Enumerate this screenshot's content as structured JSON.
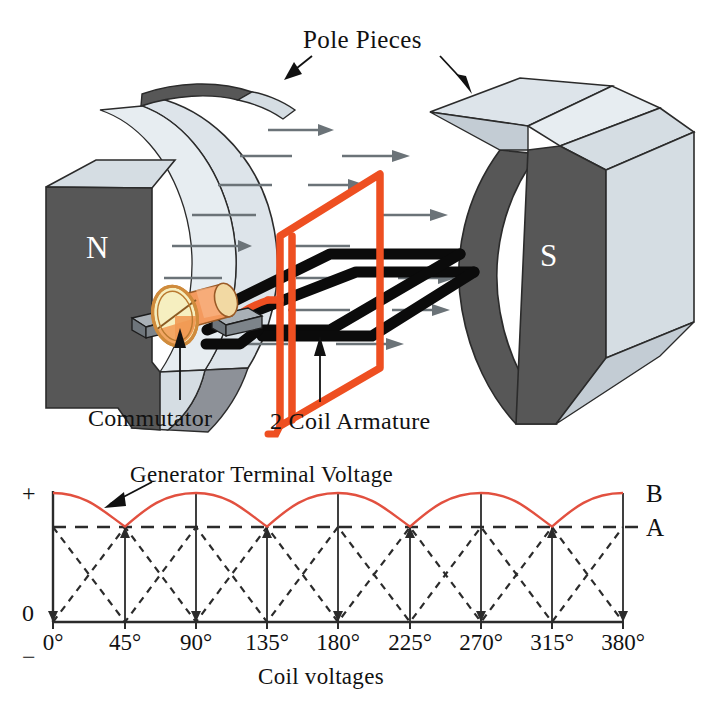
{
  "figure": {
    "title_caption": "",
    "labels": {
      "pole_pieces": "Pole Pieces",
      "commutator": "Commutator",
      "armature": "2 Coil Armature",
      "north_pole": "N",
      "south_pole": "S"
    }
  },
  "chart_data": {
    "type": "line",
    "title": "Generator Terminal Voltage",
    "xlabel": "Coil voltages",
    "ylabel": "",
    "x_tick_labels": [
      "0°",
      "45°",
      "90°",
      "135°",
      "180°",
      "225°",
      "270°",
      "315°",
      "380°"
    ],
    "x_tick_values": [
      0,
      45,
      90,
      135,
      180,
      225,
      270,
      315,
      360
    ],
    "xlim": [
      0,
      360
    ],
    "y_axis_marks": [
      "+",
      "0",
      "−"
    ],
    "y_level_labels": [
      "B",
      "A"
    ],
    "ylim": [
      0,
      1
    ],
    "grid": true,
    "legend_position": "none",
    "series": [
      {
        "name": "Generator Terminal Voltage",
        "style": "solid",
        "color": "#e2503f",
        "description": "Rectified full-wave ripple: peaks at 0, 90, 180, 270, 360 degrees; minima at 45, 135, 225, 315 degrees",
        "x": [
          0,
          45,
          90,
          135,
          180,
          225,
          270,
          315,
          360
        ],
        "values": [
          1.0,
          0.74,
          1.0,
          0.74,
          1.0,
          0.74,
          1.0,
          0.74,
          1.0
        ]
      },
      {
        "name": "Coil voltage A",
        "style": "dashed",
        "color": "#222222",
        "description": "Triangular coil voltage rising from 0 at 0 deg to level A at 45 deg then back to 0 at 90 deg, repeating",
        "x": [
          0,
          45,
          90,
          135,
          180,
          225,
          270,
          315,
          360
        ],
        "values": [
          0.0,
          0.74,
          0.0,
          0.74,
          0.0,
          0.74,
          0.0,
          0.74,
          0.0
        ]
      }
    ],
    "level_A": 0.74,
    "level_B": 1.0,
    "dashed_reference_line_at": 0.74
  },
  "annotations": [
    {
      "name": "pole-pieces-arrow-left",
      "text": "Pole Pieces"
    },
    {
      "name": "pole-pieces-arrow-right",
      "text": "Pole Pieces"
    },
    {
      "name": "commutator-leader",
      "text": "Commutator"
    },
    {
      "name": "armature-leader",
      "text": "2 Coil Armature"
    },
    {
      "name": "generator-voltage-arrow",
      "text": "Generator Terminal Voltage"
    }
  ],
  "colors": {
    "coil_red": "#ee4f21",
    "curve_red": "#e2503f",
    "magnet_dark": "#575757",
    "magnet_light": "#d5dde3",
    "magnet_mid": "#c3ccd4",
    "commutator_orange": "#f49a5e",
    "commutator_face": "#f6efc0",
    "brush_gray": "#7d848a",
    "field_arrow": "#6b7378",
    "ink": "#111111"
  },
  "axis_geometry": {
    "x_ticks_px": [
      53,
      125,
      196,
      267,
      338,
      410,
      481,
      552,
      623
    ],
    "baseline_y_px": 622,
    "level_A_y_px": 527,
    "level_B_y_px": 493
  }
}
